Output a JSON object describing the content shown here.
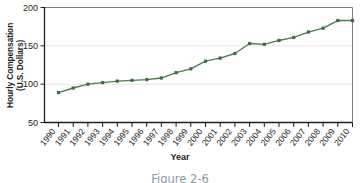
{
  "figure": {
    "caption": "Figure 2-6",
    "xaxis_title": "Year",
    "yaxis_title_line1": "Hourly Compensation",
    "yaxis_title_line2": "(U.S. Dollars)"
  },
  "chart_data": {
    "type": "line",
    "title": "",
    "xlabel": "Year",
    "ylabel": "Hourly Compensation (U.S. Dollars)",
    "x": [
      "1990",
      "1991",
      "1992",
      "1993",
      "1994",
      "1995",
      "1996",
      "1997",
      "1998",
      "1999",
      "2000",
      "2001",
      "2002",
      "2003",
      "2004",
      "2005",
      "2006",
      "2007",
      "2008",
      "2009",
      "2010"
    ],
    "values": [
      89,
      95,
      100,
      102,
      104,
      105,
      106,
      108,
      115,
      120,
      130,
      134,
      140,
      153,
      152,
      157,
      161,
      168,
      173,
      183,
      183
    ],
    "series": [
      {
        "name": "Hourly Compensation",
        "values": [
          89,
          95,
          100,
          102,
          104,
          105,
          106,
          108,
          115,
          120,
          130,
          134,
          140,
          153,
          152,
          157,
          161,
          168,
          173,
          183,
          183
        ]
      }
    ],
    "ylim": [
      50,
      200
    ],
    "yticks": [
      50,
      100,
      150,
      200
    ],
    "ytick_labels": [
      "50",
      "100",
      "150",
      "200"
    ],
    "grid": true,
    "grid_axis": "y",
    "legend": "none",
    "marker": "square",
    "line_color": "#4a7c50",
    "marker_color": "#3f6b45",
    "grid_color": "#e3e1e2",
    "axis_color": "#231f20"
  }
}
